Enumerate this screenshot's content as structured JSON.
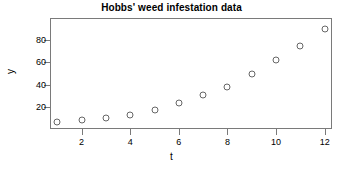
{
  "chart_data": {
    "type": "scatter",
    "title": "Hobbs' weed infestation data",
    "xlabel": "t",
    "ylabel": "y",
    "x": [
      1,
      2,
      3,
      4,
      5,
      6,
      7,
      8,
      9,
      10,
      11,
      12
    ],
    "values": [
      6,
      8,
      10,
      13,
      17,
      23,
      31,
      38,
      50,
      62,
      75,
      90
    ],
    "xticks": [
      2,
      4,
      6,
      8,
      10,
      12
    ],
    "yticks": [
      20,
      40,
      60,
      80
    ],
    "xlim": [
      0.7,
      12.3
    ],
    "ylim": [
      0,
      100
    ],
    "grid": false,
    "legend": false,
    "marker": "open-circle",
    "marker_color": "#666666",
    "axis_color": "#7a7a7a",
    "background": "#ffffff"
  }
}
